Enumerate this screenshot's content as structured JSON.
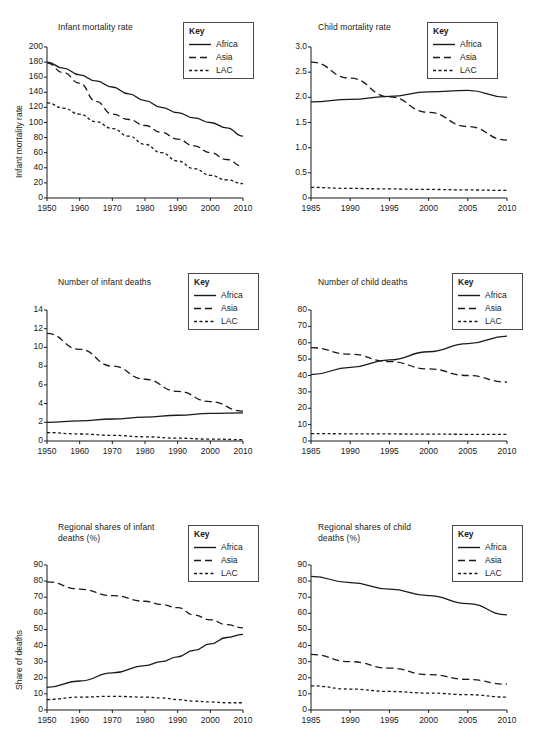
{
  "legend": {
    "title": "Key",
    "entries": [
      {
        "label": "Africa",
        "style": "solid"
      },
      {
        "label": "Asia",
        "style": "dashed"
      },
      {
        "label": "LAC",
        "style": "dotted"
      }
    ]
  },
  "chart_data": [
    {
      "id": "infant-mortality-rate",
      "type": "line",
      "title": "Infant mortality rate",
      "xlabel": "",
      "ylabel": "Infant mortality rate",
      "xlim": [
        1950,
        2010
      ],
      "ylim": [
        0,
        200
      ],
      "xticks": [
        1950,
        1960,
        1970,
        1980,
        1990,
        2000,
        2010
      ],
      "yticks": [
        0,
        20,
        40,
        60,
        80,
        100,
        120,
        140,
        160,
        180,
        200
      ],
      "grid": false,
      "legend_position": "top-right",
      "x": [
        1950,
        1955,
        1960,
        1965,
        1970,
        1975,
        1980,
        1985,
        1990,
        1995,
        2000,
        2005,
        2010
      ],
      "series": [
        {
          "name": "Africa",
          "style": "solid",
          "values": [
            180,
            172,
            163,
            155,
            147,
            138,
            129,
            120,
            113,
            106,
            100,
            93,
            82
          ]
        },
        {
          "name": "Asia",
          "style": "dashed",
          "values": [
            179,
            166,
            152,
            128,
            111,
            104,
            96,
            87,
            78,
            69,
            60,
            51,
            42
          ]
        },
        {
          "name": "LAC",
          "style": "dotted",
          "values": [
            126,
            119,
            111,
            101,
            92,
            82,
            71,
            60,
            49,
            39,
            30,
            24,
            19
          ]
        }
      ]
    },
    {
      "id": "child-mortality-rate",
      "type": "line",
      "title": "Child mortality rate",
      "xlabel": "",
      "ylabel": "",
      "xlim": [
        1985,
        2010
      ],
      "ylim": [
        0,
        3.0
      ],
      "xticks": [
        1985,
        1990,
        1995,
        2000,
        2005,
        2010
      ],
      "yticks": [
        0,
        0.5,
        1.0,
        1.5,
        2.0,
        2.5,
        3.0
      ],
      "ytick_labels": [
        "0",
        "0.5",
        "1.0",
        "1.5",
        "2.0",
        "2.5",
        "3.0"
      ],
      "grid": false,
      "legend_position": "top-right",
      "x": [
        1985,
        1990,
        1995,
        2000,
        2005,
        2010
      ],
      "series": [
        {
          "name": "Africa",
          "style": "solid",
          "values": [
            1.91,
            1.96,
            2.02,
            2.11,
            2.14,
            2.0
          ]
        },
        {
          "name": "Asia",
          "style": "dashed",
          "values": [
            2.7,
            2.38,
            2.01,
            1.7,
            1.42,
            1.15
          ]
        },
        {
          "name": "LAC",
          "style": "dotted",
          "values": [
            0.21,
            0.19,
            0.18,
            0.17,
            0.16,
            0.15
          ]
        }
      ]
    },
    {
      "id": "number-of-infant-deaths",
      "type": "line",
      "title": "Number of infant deaths",
      "xlabel": "",
      "ylabel": "",
      "xlim": [
        1950,
        2010
      ],
      "ylim": [
        0,
        14
      ],
      "xticks": [
        1950,
        1960,
        1970,
        1980,
        1990,
        2000,
        2010
      ],
      "yticks": [
        0,
        2,
        4,
        6,
        8,
        10,
        12,
        14
      ],
      "grid": false,
      "legend_position": "top-right",
      "x": [
        1950,
        1960,
        1970,
        1980,
        1990,
        2000,
        2010
      ],
      "series": [
        {
          "name": "Africa",
          "style": "solid",
          "values": [
            2.0,
            2.15,
            2.35,
            2.55,
            2.75,
            2.95,
            3.0
          ]
        },
        {
          "name": "Asia",
          "style": "dashed",
          "values": [
            11.5,
            9.8,
            8.0,
            6.6,
            5.3,
            4.2,
            3.2
          ]
        },
        {
          "name": "LAC",
          "style": "dotted",
          "values": [
            0.9,
            0.75,
            0.6,
            0.45,
            0.3,
            0.2,
            0.15
          ]
        }
      ]
    },
    {
      "id": "number-of-child-deaths",
      "type": "line",
      "title": "Number of child deaths",
      "xlabel": "",
      "ylabel": "",
      "xlim": [
        1985,
        2010
      ],
      "ylim": [
        0,
        80
      ],
      "xticks": [
        1985,
        1990,
        1995,
        2000,
        2005,
        2010
      ],
      "yticks": [
        0,
        10,
        20,
        30,
        40,
        50,
        60,
        70,
        80
      ],
      "grid": false,
      "legend_position": "top-right",
      "x": [
        1985,
        1990,
        1995,
        2000,
        2005,
        2010
      ],
      "series": [
        {
          "name": "Africa",
          "style": "solid",
          "values": [
            40.5,
            45,
            49.5,
            54.5,
            59.5,
            64
          ]
        },
        {
          "name": "Asia",
          "style": "dashed",
          "values": [
            57,
            53,
            48.5,
            44,
            40,
            36
          ]
        },
        {
          "name": "LAC",
          "style": "dotted",
          "values": [
            4.5,
            4.4,
            4.3,
            4.2,
            4.1,
            4.0
          ]
        }
      ]
    },
    {
      "id": "regional-shares-of-infant-deaths",
      "type": "line",
      "title": "Regional shares of infant\ndeaths (%)",
      "xlabel": "",
      "ylabel": "Share of deaths",
      "xlim": [
        1950,
        2010
      ],
      "ylim": [
        0,
        90
      ],
      "xticks": [
        1950,
        1960,
        1970,
        1980,
        1990,
        2000,
        2010
      ],
      "yticks": [
        0,
        10,
        20,
        30,
        40,
        50,
        60,
        70,
        80,
        90
      ],
      "grid": false,
      "legend_position": "top-right",
      "x": [
        1950,
        1960,
        1970,
        1980,
        1985,
        1990,
        1995,
        2000,
        2005,
        2010
      ],
      "series": [
        {
          "name": "Africa",
          "style": "solid",
          "values": [
            14,
            18,
            23,
            27.5,
            30,
            33,
            37,
            41,
            45,
            47
          ]
        },
        {
          "name": "Asia",
          "style": "dashed",
          "values": [
            79.5,
            75,
            71,
            67.5,
            65.5,
            63.5,
            59,
            56,
            53,
            51
          ]
        },
        {
          "name": "LAC",
          "style": "dotted",
          "values": [
            6.5,
            8,
            8.5,
            8,
            7.5,
            6.5,
            5.5,
            5,
            4.5,
            4.5
          ]
        }
      ]
    },
    {
      "id": "regional-shares-of-child-deaths",
      "type": "line",
      "title": "Regional shares of child\ndeaths (%)",
      "xlabel": "",
      "ylabel": "",
      "xlim": [
        1985,
        2010
      ],
      "ylim": [
        0,
        90
      ],
      "xticks": [
        1985,
        1990,
        1995,
        2000,
        2005,
        2010
      ],
      "yticks": [
        0,
        10,
        20,
        30,
        40,
        50,
        60,
        70,
        80,
        90
      ],
      "grid": false,
      "legend_position": "top-right",
      "x": [
        1985,
        1990,
        1995,
        2000,
        2005,
        2010
      ],
      "series": [
        {
          "name": "Africa",
          "style": "solid",
          "values": [
            83,
            79,
            75,
            71,
            66,
            59
          ]
        },
        {
          "name": "Asia",
          "style": "dashed",
          "values": [
            34.5,
            30,
            26,
            22,
            19,
            16
          ]
        },
        {
          "name": "LAC",
          "style": "dotted",
          "values": [
            15,
            13,
            11.5,
            10.5,
            9.5,
            8
          ]
        }
      ]
    }
  ]
}
